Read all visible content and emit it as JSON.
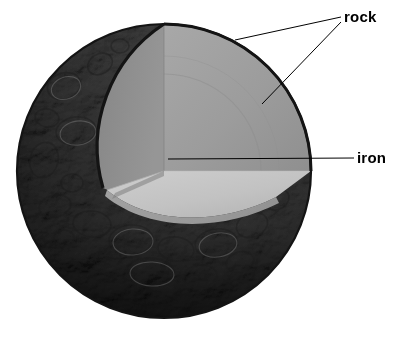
{
  "diagram": {
    "type": "planetary-interior-cutaway",
    "background_color": "#ffffff",
    "canvas": {
      "width": 412,
      "height": 339
    },
    "sphere": {
      "center_x": 164,
      "center_y": 171,
      "radius": 147,
      "outline_color": "#1a1a1a",
      "surface_name": "cratered-rocky-surface"
    },
    "layers": [
      {
        "name": "rock",
        "role": "crust-and-mantle",
        "color": "#9a9a9a",
        "cut_face_left_color": "#8e8e8e",
        "cut_face_right_color": "#a3a3a3"
      },
      {
        "name": "iron",
        "role": "core",
        "color": "#c3c3c3"
      }
    ],
    "callouts": [
      {
        "id": "rock",
        "label": "rock",
        "label_x": 344,
        "label_y": 9,
        "leader_lines": [
          {
            "from_x": 341,
            "from_y": 17,
            "to_x": 235,
            "to_y": 40
          },
          {
            "from_x": 341,
            "from_y": 22,
            "to_x": 262,
            "to_y": 104
          }
        ]
      },
      {
        "id": "iron",
        "label": "iron",
        "label_x": 357,
        "label_y": 150,
        "leader_lines": [
          {
            "from_x": 354,
            "from_y": 158,
            "to_x": 168,
            "to_y": 159
          }
        ]
      }
    ],
    "leader_line_color": "#000000",
    "leader_line_width": 1
  }
}
